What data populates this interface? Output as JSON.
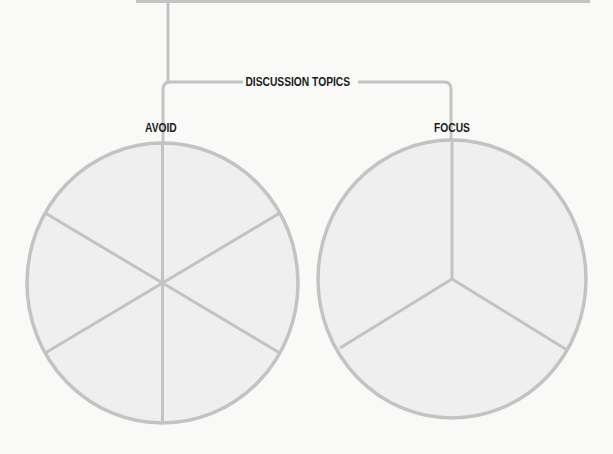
{
  "diagram": {
    "title": "DISCUSSION TOPICS",
    "branches": [
      {
        "label": "AVOID",
        "segments": 6
      },
      {
        "label": "FOCUS",
        "segments": 3
      }
    ]
  },
  "colors": {
    "background": "#f9f9f8",
    "line": "#c3c3c3",
    "circle_fill": "#efefef",
    "text": "#1b1b1b"
  }
}
